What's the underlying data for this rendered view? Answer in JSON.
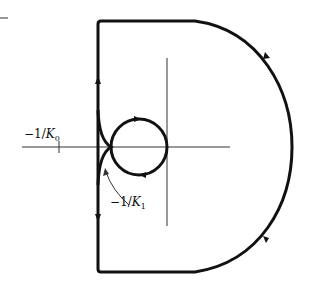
{
  "figure": {
    "type": "nyquist-contour",
    "labels": {
      "k0": {
        "prefix": "−1/",
        "var": "K",
        "sub": "0"
      },
      "k1": {
        "prefix": "−1/",
        "var": "K",
        "sub": "1"
      }
    },
    "colors": {
      "curve": "#111111",
      "axis": "#333333"
    }
  }
}
